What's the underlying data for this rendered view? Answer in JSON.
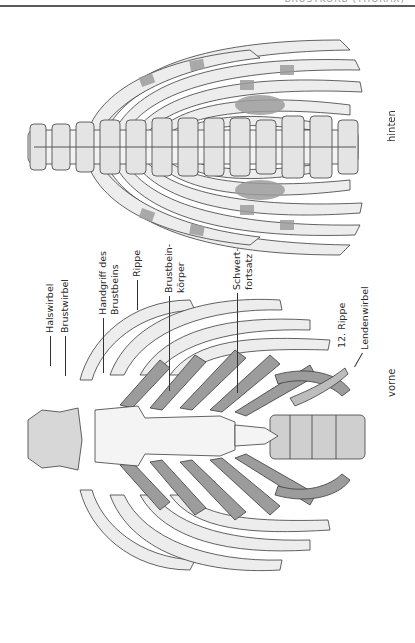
{
  "header": {
    "title": "BRUSTKORB (THORAX)"
  },
  "figures": {
    "posterior": {
      "view_label": "hinten"
    },
    "anterior": {
      "view_label": "vorne",
      "labels": {
        "halswirbel": "Halswirbel",
        "brustwirbel": "Brustwirbel",
        "handgriff_line1": "Handgriff des",
        "handgriff_line2": "Brustbeins",
        "rippe": "Rippe",
        "brustbeinkoerper_line1": "Brustbein-",
        "brustbeinkoerper_line2": "körper",
        "schwertfortsatz_line1": "Schwert-",
        "schwertfortsatz_line2": "fortsatz",
        "rippe12": "12. Rippe",
        "lendenwirbel": "Lendenwirbel"
      }
    }
  },
  "colors": {
    "bone": "#ededed",
    "cartilage": "#9c9c9c",
    "outline": "#3c3c3c",
    "rule": "#5a5a5a"
  }
}
